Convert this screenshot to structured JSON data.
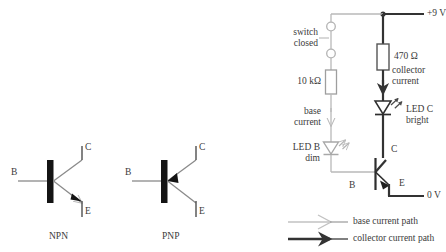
{
  "diagram": {
    "colors": {
      "base_path": "#b9b9b9",
      "collector_path": "#333333",
      "wire": "#808080",
      "text": "#3a3a3a",
      "body": "#1a1a1a",
      "background": "#ffffff"
    }
  },
  "symbols": {
    "npn": {
      "name": "NPN",
      "base_label": "B",
      "collector_label": "C",
      "emitter_label": "E",
      "arrow_direction": "out-of-base"
    },
    "pnp": {
      "name": "PNP",
      "base_label": "B",
      "collector_label": "C",
      "emitter_label": "E",
      "arrow_direction": "into-base"
    }
  },
  "circuit": {
    "supply_label": "+9 V",
    "ground_label": "0 V",
    "switch_label_line1": "switch",
    "switch_label_line2": "closed",
    "base_resistor": "10 kΩ",
    "collector_resistor": "470 Ω",
    "base_current_line1": "base",
    "base_current_line2": "current",
    "collector_current_line1": "collector",
    "collector_current_line2": "current",
    "led_b_line1": "LED B",
    "led_b_line2": "dim",
    "led_c_line1": "LED C",
    "led_c_line2": "bright",
    "transistor_base_label": "B",
    "transistor_collector_label": "C",
    "transistor_emitter_label": "E"
  },
  "legend": {
    "items": [
      {
        "label": "base current path",
        "style": "thin-gray"
      },
      {
        "label": "collector current path",
        "style": "thick-black"
      }
    ]
  }
}
